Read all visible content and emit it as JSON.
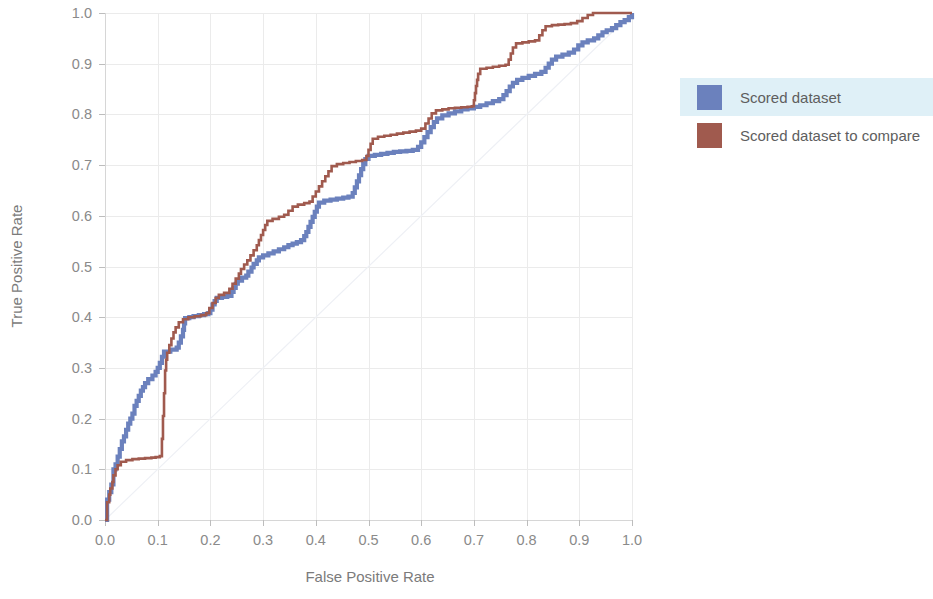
{
  "chart_data": {
    "type": "line",
    "title": "",
    "subtitle": "",
    "xlabel": "False Positive Rate",
    "ylabel": "True Positive Rate",
    "xlim": [
      0.0,
      1.0
    ],
    "ylim": [
      0.0,
      1.0
    ],
    "grid": true,
    "legend_position": "right",
    "x_ticks": [
      "0.0",
      "0.1",
      "0.2",
      "0.3",
      "0.4",
      "0.5",
      "0.6",
      "0.7",
      "0.8",
      "0.9",
      "1.0"
    ],
    "y_ticks": [
      "0.0",
      "0.1",
      "0.2",
      "0.3",
      "0.4",
      "0.5",
      "0.6",
      "0.7",
      "0.8",
      "0.9",
      "1.0"
    ],
    "x_tick_values": [
      0.0,
      0.1,
      0.2,
      0.3,
      0.4,
      0.5,
      0.6,
      0.7,
      0.8,
      0.9,
      1.0
    ],
    "y_tick_values": [
      0.0,
      0.1,
      0.2,
      0.3,
      0.4,
      0.5,
      0.6,
      0.7,
      0.8,
      0.9,
      1.0
    ],
    "reference_line": {
      "name": "random-classifier",
      "from": [
        0.0,
        0.0
      ],
      "to": [
        1.0,
        1.0
      ]
    },
    "series": [
      {
        "name": "Scored dataset",
        "color": "#6b81bd",
        "stroke_width": 4.2,
        "points": [
          [
            0.0,
            0.0
          ],
          [
            0.004,
            0.02
          ],
          [
            0.004,
            0.04
          ],
          [
            0.008,
            0.055
          ],
          [
            0.012,
            0.07
          ],
          [
            0.016,
            0.085
          ],
          [
            0.016,
            0.1
          ],
          [
            0.02,
            0.11
          ],
          [
            0.024,
            0.125
          ],
          [
            0.028,
            0.14
          ],
          [
            0.032,
            0.155
          ],
          [
            0.036,
            0.165
          ],
          [
            0.04,
            0.178
          ],
          [
            0.044,
            0.19
          ],
          [
            0.048,
            0.2
          ],
          [
            0.052,
            0.21
          ],
          [
            0.056,
            0.225
          ],
          [
            0.06,
            0.235
          ],
          [
            0.064,
            0.245
          ],
          [
            0.068,
            0.255
          ],
          [
            0.072,
            0.262
          ],
          [
            0.076,
            0.27
          ],
          [
            0.082,
            0.278
          ],
          [
            0.09,
            0.285
          ],
          [
            0.096,
            0.292
          ],
          [
            0.1,
            0.3
          ],
          [
            0.104,
            0.31
          ],
          [
            0.108,
            0.322
          ],
          [
            0.112,
            0.332
          ],
          [
            0.124,
            0.336
          ],
          [
            0.136,
            0.34
          ],
          [
            0.14,
            0.35
          ],
          [
            0.144,
            0.362
          ],
          [
            0.148,
            0.375
          ],
          [
            0.15,
            0.388
          ],
          [
            0.152,
            0.398
          ],
          [
            0.16,
            0.4
          ],
          [
            0.168,
            0.402
          ],
          [
            0.178,
            0.404
          ],
          [
            0.188,
            0.406
          ],
          [
            0.196,
            0.408
          ],
          [
            0.2,
            0.415
          ],
          [
            0.204,
            0.425
          ],
          [
            0.208,
            0.432
          ],
          [
            0.212,
            0.438
          ],
          [
            0.222,
            0.44
          ],
          [
            0.232,
            0.442
          ],
          [
            0.24,
            0.45
          ],
          [
            0.244,
            0.458
          ],
          [
            0.248,
            0.466
          ],
          [
            0.252,
            0.472
          ],
          [
            0.26,
            0.478
          ],
          [
            0.268,
            0.482
          ],
          [
            0.272,
            0.49
          ],
          [
            0.278,
            0.498
          ],
          [
            0.282,
            0.505
          ],
          [
            0.288,
            0.512
          ],
          [
            0.292,
            0.518
          ],
          [
            0.3,
            0.522
          ],
          [
            0.31,
            0.526
          ],
          [
            0.32,
            0.53
          ],
          [
            0.33,
            0.534
          ],
          [
            0.34,
            0.538
          ],
          [
            0.348,
            0.542
          ],
          [
            0.356,
            0.545
          ],
          [
            0.364,
            0.548
          ],
          [
            0.372,
            0.552
          ],
          [
            0.378,
            0.56
          ],
          [
            0.382,
            0.568
          ],
          [
            0.386,
            0.578
          ],
          [
            0.39,
            0.588
          ],
          [
            0.394,
            0.598
          ],
          [
            0.398,
            0.608
          ],
          [
            0.402,
            0.618
          ],
          [
            0.406,
            0.626
          ],
          [
            0.416,
            0.63
          ],
          [
            0.428,
            0.632
          ],
          [
            0.44,
            0.634
          ],
          [
            0.452,
            0.636
          ],
          [
            0.462,
            0.638
          ],
          [
            0.47,
            0.645
          ],
          [
            0.474,
            0.656
          ],
          [
            0.478,
            0.668
          ],
          [
            0.482,
            0.68
          ],
          [
            0.486,
            0.692
          ],
          [
            0.49,
            0.702
          ],
          [
            0.494,
            0.712
          ],
          [
            0.5,
            0.718
          ],
          [
            0.512,
            0.72
          ],
          [
            0.524,
            0.722
          ],
          [
            0.536,
            0.724
          ],
          [
            0.548,
            0.726
          ],
          [
            0.56,
            0.727
          ],
          [
            0.572,
            0.728
          ],
          [
            0.584,
            0.73
          ],
          [
            0.594,
            0.736
          ],
          [
            0.6,
            0.745
          ],
          [
            0.606,
            0.755
          ],
          [
            0.612,
            0.765
          ],
          [
            0.618,
            0.775
          ],
          [
            0.624,
            0.785
          ],
          [
            0.63,
            0.792
          ],
          [
            0.64,
            0.798
          ],
          [
            0.652,
            0.802
          ],
          [
            0.664,
            0.806
          ],
          [
            0.676,
            0.81
          ],
          [
            0.688,
            0.812
          ],
          [
            0.7,
            0.815
          ],
          [
            0.712,
            0.818
          ],
          [
            0.724,
            0.822
          ],
          [
            0.736,
            0.826
          ],
          [
            0.748,
            0.83
          ],
          [
            0.756,
            0.838
          ],
          [
            0.762,
            0.846
          ],
          [
            0.768,
            0.855
          ],
          [
            0.774,
            0.862
          ],
          [
            0.782,
            0.868
          ],
          [
            0.792,
            0.872
          ],
          [
            0.804,
            0.876
          ],
          [
            0.816,
            0.88
          ],
          [
            0.828,
            0.884
          ],
          [
            0.836,
            0.892
          ],
          [
            0.842,
            0.9
          ],
          [
            0.848,
            0.908
          ],
          [
            0.856,
            0.914
          ],
          [
            0.868,
            0.918
          ],
          [
            0.88,
            0.922
          ],
          [
            0.89,
            0.928
          ],
          [
            0.898,
            0.936
          ],
          [
            0.906,
            0.942
          ],
          [
            0.916,
            0.946
          ],
          [
            0.928,
            0.95
          ],
          [
            0.936,
            0.956
          ],
          [
            0.944,
            0.962
          ],
          [
            0.952,
            0.966
          ],
          [
            0.962,
            0.97
          ],
          [
            0.97,
            0.976
          ],
          [
            0.978,
            0.982
          ],
          [
            0.986,
            0.986
          ],
          [
            0.994,
            0.992
          ],
          [
            1.0,
            1.0
          ]
        ]
      },
      {
        "name": "Scored dataset to compare",
        "color": "#a05a4e",
        "stroke_width": 2.6,
        "points": [
          [
            0.0,
            0.0
          ],
          [
            0.004,
            0.018
          ],
          [
            0.004,
            0.035
          ],
          [
            0.008,
            0.05
          ],
          [
            0.01,
            0.062
          ],
          [
            0.014,
            0.075
          ],
          [
            0.016,
            0.088
          ],
          [
            0.02,
            0.1
          ],
          [
            0.024,
            0.108
          ],
          [
            0.03,
            0.115
          ],
          [
            0.04,
            0.118
          ],
          [
            0.052,
            0.12
          ],
          [
            0.064,
            0.121
          ],
          [
            0.076,
            0.122
          ],
          [
            0.088,
            0.123
          ],
          [
            0.096,
            0.124
          ],
          [
            0.104,
            0.126
          ],
          [
            0.108,
            0.14
          ],
          [
            0.108,
            0.16
          ],
          [
            0.11,
            0.182
          ],
          [
            0.11,
            0.205
          ],
          [
            0.112,
            0.228
          ],
          [
            0.112,
            0.25
          ],
          [
            0.114,
            0.272
          ],
          [
            0.114,
            0.295
          ],
          [
            0.116,
            0.316
          ],
          [
            0.118,
            0.33
          ],
          [
            0.122,
            0.345
          ],
          [
            0.126,
            0.358
          ],
          [
            0.13,
            0.37
          ],
          [
            0.134,
            0.38
          ],
          [
            0.14,
            0.39
          ],
          [
            0.148,
            0.396
          ],
          [
            0.158,
            0.4
          ],
          [
            0.17,
            0.402
          ],
          [
            0.182,
            0.404
          ],
          [
            0.192,
            0.408
          ],
          [
            0.198,
            0.418
          ],
          [
            0.204,
            0.428
          ],
          [
            0.21,
            0.438
          ],
          [
            0.216,
            0.444
          ],
          [
            0.226,
            0.448
          ],
          [
            0.236,
            0.456
          ],
          [
            0.242,
            0.466
          ],
          [
            0.248,
            0.476
          ],
          [
            0.254,
            0.486
          ],
          [
            0.258,
            0.495
          ],
          [
            0.264,
            0.504
          ],
          [
            0.27,
            0.512
          ],
          [
            0.276,
            0.522
          ],
          [
            0.282,
            0.532
          ],
          [
            0.288,
            0.542
          ],
          [
            0.292,
            0.552
          ],
          [
            0.296,
            0.562
          ],
          [
            0.3,
            0.572
          ],
          [
            0.304,
            0.582
          ],
          [
            0.308,
            0.59
          ],
          [
            0.318,
            0.594
          ],
          [
            0.33,
            0.598
          ],
          [
            0.34,
            0.602
          ],
          [
            0.348,
            0.61
          ],
          [
            0.356,
            0.618
          ],
          [
            0.366,
            0.622
          ],
          [
            0.378,
            0.625
          ],
          [
            0.388,
            0.628
          ],
          [
            0.394,
            0.638
          ],
          [
            0.4,
            0.648
          ],
          [
            0.406,
            0.658
          ],
          [
            0.412,
            0.668
          ],
          [
            0.418,
            0.678
          ],
          [
            0.424,
            0.688
          ],
          [
            0.43,
            0.698
          ],
          [
            0.44,
            0.702
          ],
          [
            0.452,
            0.704
          ],
          [
            0.464,
            0.706
          ],
          [
            0.476,
            0.708
          ],
          [
            0.488,
            0.71
          ],
          [
            0.496,
            0.718
          ],
          [
            0.5,
            0.73
          ],
          [
            0.504,
            0.742
          ],
          [
            0.508,
            0.752
          ],
          [
            0.518,
            0.756
          ],
          [
            0.53,
            0.758
          ],
          [
            0.542,
            0.76
          ],
          [
            0.554,
            0.762
          ],
          [
            0.566,
            0.764
          ],
          [
            0.578,
            0.766
          ],
          [
            0.59,
            0.768
          ],
          [
            0.6,
            0.772
          ],
          [
            0.608,
            0.782
          ],
          [
            0.614,
            0.792
          ],
          [
            0.62,
            0.802
          ],
          [
            0.628,
            0.808
          ],
          [
            0.64,
            0.81
          ],
          [
            0.652,
            0.812
          ],
          [
            0.664,
            0.813
          ],
          [
            0.676,
            0.814
          ],
          [
            0.688,
            0.815
          ],
          [
            0.696,
            0.816
          ],
          [
            0.7,
            0.828
          ],
          [
            0.702,
            0.842
          ],
          [
            0.704,
            0.856
          ],
          [
            0.706,
            0.868
          ],
          [
            0.708,
            0.88
          ],
          [
            0.712,
            0.89
          ],
          [
            0.724,
            0.892
          ],
          [
            0.736,
            0.894
          ],
          [
            0.748,
            0.896
          ],
          [
            0.76,
            0.898
          ],
          [
            0.766,
            0.908
          ],
          [
            0.77,
            0.92
          ],
          [
            0.774,
            0.932
          ],
          [
            0.78,
            0.94
          ],
          [
            0.792,
            0.942
          ],
          [
            0.804,
            0.944
          ],
          [
            0.816,
            0.946
          ],
          [
            0.824,
            0.956
          ],
          [
            0.83,
            0.966
          ],
          [
            0.836,
            0.974
          ],
          [
            0.848,
            0.976
          ],
          [
            0.86,
            0.977
          ],
          [
            0.872,
            0.978
          ],
          [
            0.884,
            0.98
          ],
          [
            0.896,
            0.984
          ],
          [
            0.906,
            0.99
          ],
          [
            0.916,
            0.996
          ],
          [
            0.926,
            1.0
          ],
          [
            0.94,
            1.0
          ],
          [
            0.955,
            1.0
          ],
          [
            0.97,
            1.0
          ],
          [
            0.985,
            1.0
          ],
          [
            1.0,
            1.0
          ]
        ]
      }
    ]
  },
  "legend": {
    "items": [
      {
        "label": "Scored dataset",
        "color": "#6b81bd",
        "highlighted": true
      },
      {
        "label": "Scored dataset to compare",
        "color": "#a05a4e",
        "highlighted": false
      }
    ]
  }
}
